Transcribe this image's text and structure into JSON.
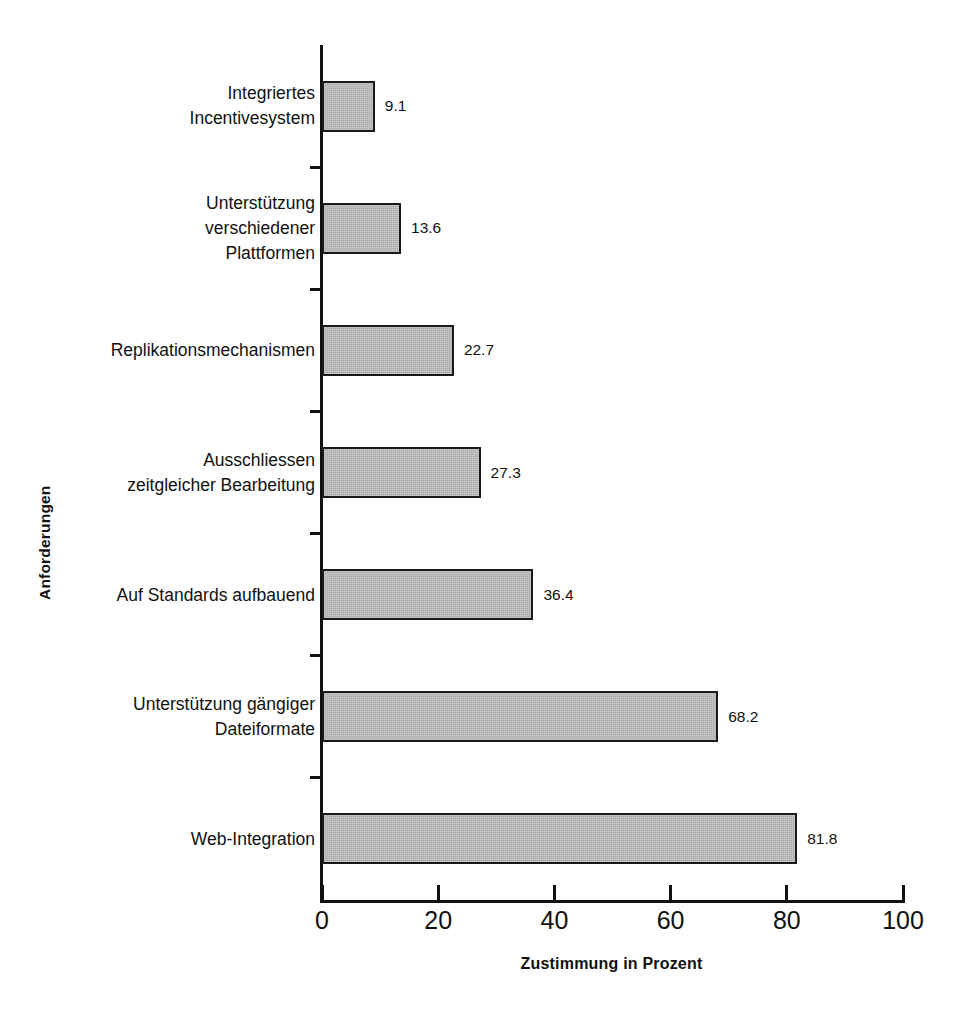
{
  "chart_data": {
    "type": "bar",
    "orientation": "horizontal",
    "title": "",
    "xlabel": "Zustimmung in Prozent",
    "ylabel": "Anforderungen",
    "xlim": [
      0,
      100
    ],
    "xticks": [
      0,
      20,
      40,
      60,
      80,
      100
    ],
    "xtick_labels": [
      "0",
      "20",
      "40",
      "60",
      "80",
      "100"
    ],
    "grid": false,
    "legend": null,
    "bar_color": "#a9a9a9",
    "bar_edge_color": "#1a1a1a",
    "axis_color": "#111111",
    "categories": [
      "Integriertes\nIncentivesystem",
      "Unterstützung\nverschiedener\nPlattformen",
      "Replikationsmechanismen",
      "Ausschliessen\nzeitgleicher Bearbeitung",
      "Auf Standards aufbauend",
      "Unterstützung gängiger\nDateiformate",
      "Web-Integration"
    ],
    "values": [
      9.1,
      13.6,
      22.7,
      27.3,
      36.4,
      68.2,
      81.8
    ],
    "value_labels": [
      "9.1",
      "13.6",
      "22.7",
      "27.3",
      "36.4",
      "68.2",
      "81.8"
    ]
  }
}
